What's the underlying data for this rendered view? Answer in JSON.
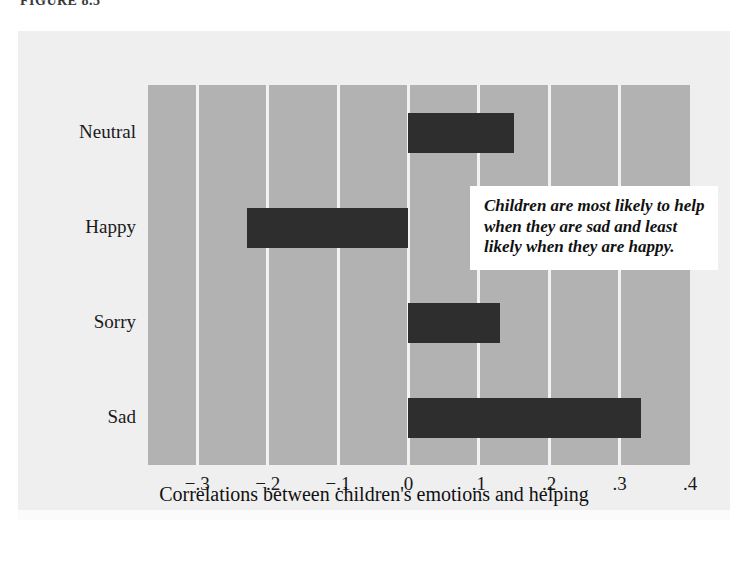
{
  "figure": {
    "label": "FIGURE 8.5"
  },
  "annotation": {
    "text": "Children are most likely to help when they are sad and least likely when they are happy."
  },
  "colors": {
    "plot_background": "#b2b2b2",
    "panel_background": "#efeff0",
    "bar": "#2e2e2e",
    "gridline": "#f2f2f2",
    "text": "#1a1a1a"
  },
  "chart_data": {
    "type": "bar",
    "orientation": "horizontal",
    "title": "",
    "xlabel": "Correlations between children's emotions and helping",
    "ylabel": "",
    "categories": [
      "Neutral",
      "Happy",
      "Sorry",
      "Sad"
    ],
    "values": [
      0.15,
      -0.23,
      0.13,
      0.33
    ],
    "xlim": [
      -0.37,
      0.4
    ],
    "xticks": [
      -0.3,
      -0.2,
      -0.1,
      0,
      0.1,
      0.2,
      0.3,
      0.4
    ],
    "xtick_labels": [
      "−.3",
      "−.2",
      "−.1",
      "0",
      ".1",
      ".2",
      ".3",
      ".4"
    ],
    "grid": true,
    "legend": false,
    "annotations": [
      "Children are most likely to help when they are sad and least likely when they are happy."
    ]
  }
}
